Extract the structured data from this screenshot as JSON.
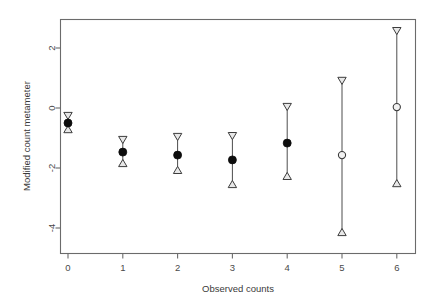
{
  "chart_data": {
    "type": "scatter",
    "title": "",
    "xlabel": "Observed counts",
    "ylabel": "Modified count metameter",
    "grid": false,
    "legend": null,
    "xlim": [
      -0.35,
      6.35
    ],
    "ylim": [
      -5.1,
      3.15
    ],
    "xticks": [
      0,
      1,
      2,
      3,
      4,
      5,
      6
    ],
    "xticklabels": [
      "0",
      "1",
      "2",
      "3",
      "4",
      "5",
      "6"
    ],
    "yticks": [
      2,
      0,
      -2,
      -4
    ],
    "yticklabels": [
      "2",
      "0",
      "-2",
      "-4"
    ],
    "marker_styles": {
      "center_filled": "filled-circle",
      "center_open": "open-circle",
      "upper_cap": "down-triangle",
      "lower_cap": "up-triangle"
    },
    "x": [
      0,
      1,
      2,
      3,
      4,
      5,
      6
    ],
    "series": [
      {
        "name": "Estimate",
        "values": [
          -0.5,
          -1.47,
          -1.57,
          -1.73,
          -1.17,
          -1.57,
          0.03
        ],
        "fills": [
          "filled",
          "filled",
          "filled",
          "filled",
          "filled",
          "open",
          "open"
        ]
      },
      {
        "name": "Upper limit",
        "values": [
          -0.3,
          -1.1,
          -1.0,
          -0.97,
          0.0,
          0.87,
          2.53
        ]
      },
      {
        "name": "Lower limit",
        "values": [
          -0.67,
          -1.8,
          -2.03,
          -2.5,
          -2.23,
          -4.1,
          -2.47
        ]
      }
    ],
    "points": [
      {
        "x": 0,
        "estimate": -0.5,
        "upper": -0.3,
        "lower": -0.67,
        "fill": "filled"
      },
      {
        "x": 1,
        "estimate": -1.47,
        "upper": -1.1,
        "lower": -1.8,
        "fill": "filled"
      },
      {
        "x": 2,
        "estimate": -1.57,
        "upper": -1.0,
        "lower": -2.03,
        "fill": "filled"
      },
      {
        "x": 3,
        "estimate": -1.73,
        "upper": -0.97,
        "lower": -2.5,
        "fill": "filled"
      },
      {
        "x": 4,
        "estimate": -1.17,
        "upper": 0.0,
        "lower": -2.23,
        "fill": "filled"
      },
      {
        "x": 5,
        "estimate": -1.57,
        "upper": 0.87,
        "lower": -4.1,
        "fill": "open"
      },
      {
        "x": 6,
        "estimate": 0.03,
        "upper": 2.53,
        "lower": -2.47,
        "fill": "open"
      }
    ]
  }
}
